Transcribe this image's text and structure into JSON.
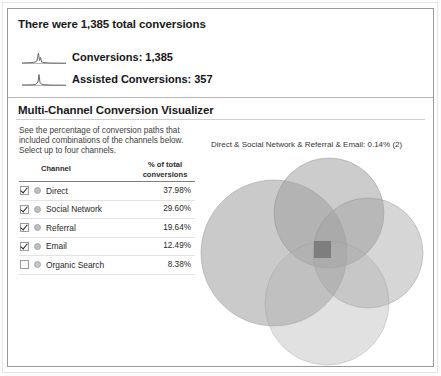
{
  "summary": {
    "title": "There were 1,385 total conversions",
    "metrics": [
      {
        "icon": "sparkline-icon",
        "label": "Conversions: 1,385"
      },
      {
        "icon": "sparkline-icon",
        "label": "Assisted Conversions: 357"
      }
    ]
  },
  "visualizer": {
    "title": "Multi-Channel Conversion Visualizer",
    "description": [
      "See the percentage of conversion paths that",
      "included combinations of the channels below.",
      "Select up to four channels."
    ],
    "table": {
      "headers": {
        "channel": "Channel",
        "pct_line1": "% of total",
        "pct_line2": "conversions"
      },
      "rows": [
        {
          "name": "Direct",
          "pct": "37.98%",
          "checked": true,
          "swatch": "#bdbdbd"
        },
        {
          "name": "Social Network",
          "pct": "29.60%",
          "checked": true,
          "swatch": "#bdbdbd"
        },
        {
          "name": "Referral",
          "pct": "19.64%",
          "checked": true,
          "swatch": "#bdbdbd"
        },
        {
          "name": "Email",
          "pct": "12.49%",
          "checked": true,
          "swatch": "#bdbdbd"
        },
        {
          "name": "Organic Search",
          "pct": "8.38%",
          "checked": false,
          "swatch": "#c6c6c6"
        }
      ]
    },
    "venn": {
      "annotation": "Direct & Social Network & Referral & Email: 0.14% (2)",
      "intersection_label": "Direct & Social Network & Referral & Email",
      "intersection_pct": "0.14%",
      "intersection_count": "(2)",
      "circles": [
        {
          "channel": "Direct",
          "cx": 78,
          "cy": 98,
          "r": 73,
          "fill": "#9e9e9e",
          "opacity": 0.55
        },
        {
          "channel": "Social Network",
          "cx": 133,
          "cy": 58,
          "r": 55,
          "fill": "#9e9e9e",
          "opacity": 0.52
        },
        {
          "channel": "Referral",
          "cx": 172,
          "cy": 98,
          "r": 55,
          "fill": "#9e9e9e",
          "opacity": 0.42
        },
        {
          "channel": "Email",
          "cx": 131,
          "cy": 148,
          "r": 62,
          "fill": "#b0b0b0",
          "opacity": 0.38
        }
      ]
    }
  }
}
